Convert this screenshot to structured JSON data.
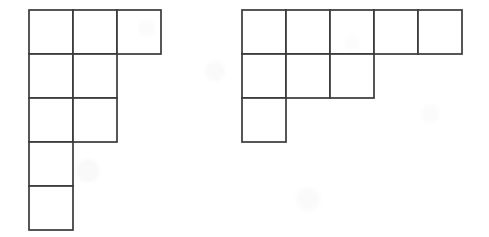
{
  "page": {
    "background_color": "#ffffff",
    "width": 489,
    "height": 237
  },
  "style": {
    "line_color": "#3a3a3a",
    "cell_fill": "#ffffff",
    "line_width": 1.7
  },
  "figures": [
    {
      "id": "left-polyomino",
      "name": "left-polyomino",
      "label": "",
      "cell_size": 44,
      "origin_x": 29,
      "origin_y": 10,
      "rows": 5,
      "cols": 3,
      "cell_count": 9,
      "row_widths": [
        3,
        2,
        2,
        1,
        1
      ],
      "cells": [
        {
          "row": 0,
          "col": 0
        },
        {
          "row": 0,
          "col": 1
        },
        {
          "row": 0,
          "col": 2
        },
        {
          "row": 1,
          "col": 0
        },
        {
          "row": 1,
          "col": 1
        },
        {
          "row": 2,
          "col": 0
        },
        {
          "row": 2,
          "col": 1
        },
        {
          "row": 3,
          "col": 0
        },
        {
          "row": 4,
          "col": 0
        }
      ]
    },
    {
      "id": "right-polyomino",
      "name": "right-polyomino",
      "label": "",
      "cell_size": 44,
      "origin_x": 242,
      "origin_y": 10,
      "rows": 3,
      "cols": 5,
      "cell_count": 9,
      "row_widths": [
        5,
        3,
        1
      ],
      "cells": [
        {
          "row": 0,
          "col": 0
        },
        {
          "row": 0,
          "col": 1
        },
        {
          "row": 0,
          "col": 2
        },
        {
          "row": 0,
          "col": 3
        },
        {
          "row": 0,
          "col": 4
        },
        {
          "row": 1,
          "col": 0
        },
        {
          "row": 1,
          "col": 1
        },
        {
          "row": 1,
          "col": 2
        },
        {
          "row": 2,
          "col": 0
        }
      ]
    }
  ]
}
